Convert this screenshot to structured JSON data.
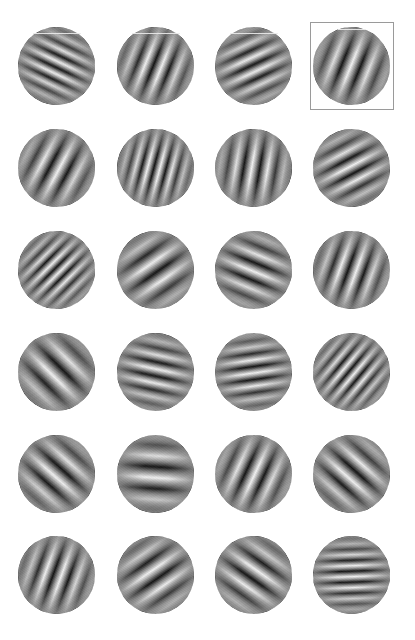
{
  "layout": {
    "columns_x": [
      57,
      156,
      254,
      352
    ],
    "rows_y": [
      66,
      168,
      270,
      372,
      474,
      575
    ],
    "patch_diameter": 78
  },
  "colors": {
    "background": "#ffffff",
    "mean_gray": "#8a8a8a",
    "light": "#f4f4f4",
    "dark": "#101010",
    "selection_border": "#9a9a9a"
  },
  "selected": {
    "row": 0,
    "col": 3
  },
  "patches": [
    [
      {
        "angle": -25,
        "wavelength": 12,
        "phase": "light"
      },
      {
        "angle": 68,
        "wavelength": 16,
        "phase": "light"
      },
      {
        "angle": 25,
        "wavelength": 14,
        "phase": "light"
      },
      {
        "angle": 68,
        "wavelength": 18,
        "phase": "light"
      }
    ],
    [
      {
        "angle": 62,
        "wavelength": 18,
        "phase": "light"
      },
      {
        "angle": 75,
        "wavelength": 12,
        "phase": "dark"
      },
      {
        "angle": 80,
        "wavelength": 16,
        "phase": "light"
      },
      {
        "angle": 28,
        "wavelength": 15,
        "phase": "dark"
      }
    ],
    [
      {
        "angle": 45,
        "wavelength": 11,
        "phase": "light"
      },
      {
        "angle": 35,
        "wavelength": 20,
        "phase": "dark"
      },
      {
        "angle": -22,
        "wavelength": 17,
        "phase": "light"
      },
      {
        "angle": 70,
        "wavelength": 16,
        "phase": "light"
      }
    ],
    [
      {
        "angle": -45,
        "wavelength": 22,
        "phase": "light"
      },
      {
        "angle": -12,
        "wavelength": 14,
        "phase": "light"
      },
      {
        "angle": 8,
        "wavelength": 13,
        "phase": "dark"
      },
      {
        "angle": 50,
        "wavelength": 11,
        "phase": "light"
      }
    ],
    [
      {
        "angle": -42,
        "wavelength": 20,
        "phase": "light"
      },
      {
        "angle": -4,
        "wavelength": 22,
        "phase": "light"
      },
      {
        "angle": 65,
        "wavelength": 18,
        "phase": "light"
      },
      {
        "angle": -42,
        "wavelength": 19,
        "phase": "light"
      }
    ],
    [
      {
        "angle": 70,
        "wavelength": 16,
        "phase": "light"
      },
      {
        "angle": 35,
        "wavelength": 19,
        "phase": "dark"
      },
      {
        "angle": -35,
        "wavelength": 19,
        "phase": "dark"
      },
      {
        "angle": 2,
        "wavelength": 11,
        "phase": "light"
      }
    ]
  ]
}
